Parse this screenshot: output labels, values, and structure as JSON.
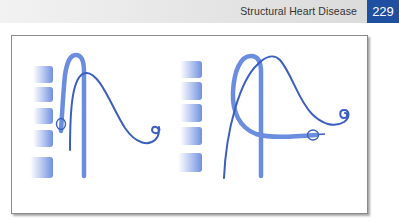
{
  "header": {
    "section_title": "Structural Heart Disease",
    "page_number": "229"
  },
  "figure": {
    "panels": [
      {
        "id": "left-panel",
        "vertebra_count": 5
      },
      {
        "id": "right-panel",
        "vertebra_count": 5
      }
    ],
    "colors": {
      "header_accent": "#1f4fa0",
      "wire": "#3a5fc0",
      "sheath": "#6a8de0",
      "vertebra": "#6f8fe0"
    }
  }
}
